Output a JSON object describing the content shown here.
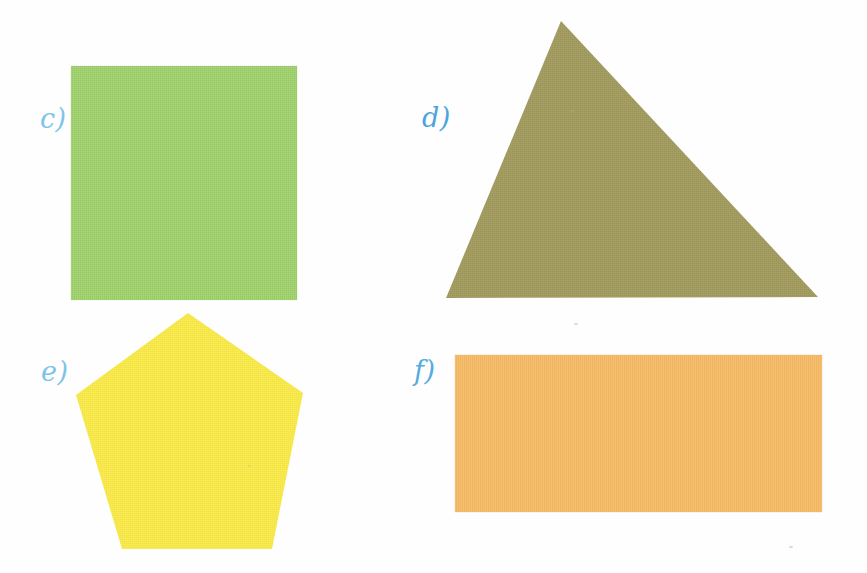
{
  "page": {
    "kind": "worksheet-figure-sheet",
    "background_color": "#fefefe",
    "width": 867,
    "height": 573
  },
  "labels": {
    "c": "c)",
    "d": "d)",
    "e": "e)",
    "f": "f)"
  },
  "label_colors": {
    "c": "#7ec4e8",
    "d": "#4da3dd",
    "e": "#7ec4e8",
    "f": "#55aadf"
  },
  "shapes": [
    {
      "id": "c",
      "label": "c)",
      "name": "square",
      "fill": "#9ed16b",
      "color_name": "green",
      "bounds": {
        "x": 71,
        "y": 66,
        "width": 226,
        "height": 234
      },
      "sides": 4
    },
    {
      "id": "d",
      "label": "d)",
      "name": "triangle",
      "fill": "#a39c62",
      "color_name": "olive",
      "bounds": {
        "x": 440,
        "y": 14,
        "width": 386,
        "height": 290
      },
      "sides": 3,
      "points": "121,7 378,283 6,284"
    },
    {
      "id": "e",
      "label": "e)",
      "name": "pentagon",
      "fill": "#f7e84a",
      "color_name": "yellow",
      "bounds": {
        "x": 70,
        "y": 308,
        "width": 240,
        "height": 248
      },
      "sides": 5,
      "points": "118,5 233,85 202,241 52,241 6,87"
    },
    {
      "id": "f",
      "label": "f)",
      "name": "rectangle",
      "fill": "#f5b963",
      "color_name": "orange",
      "bounds": {
        "x": 455,
        "y": 355,
        "width": 367,
        "height": 157
      },
      "sides": 4
    }
  ]
}
